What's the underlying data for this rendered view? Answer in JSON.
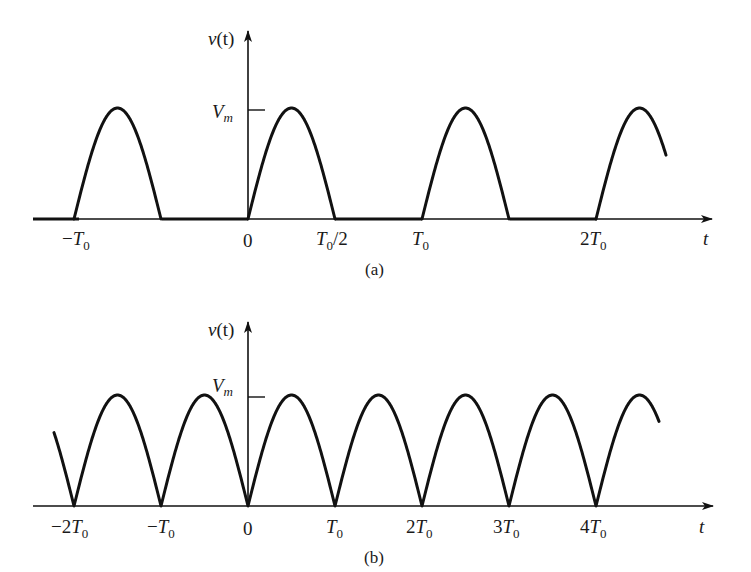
{
  "figure": {
    "panels": [
      {
        "id": "a",
        "caption": "(a)",
        "description": "Half-wave rectified sinusoid",
        "y_axis_label": {
          "base": "v",
          "arg": "(t)"
        },
        "x_axis_label": "t",
        "peak_label": {
          "base": "V",
          "sub": "m"
        },
        "ticks": [
          {
            "prefix": "−",
            "base": "T",
            "sub": "0",
            "suffix": "",
            "value": -1.0
          },
          {
            "prefix": "",
            "base": "0",
            "sub": "",
            "suffix": "",
            "value": 0.0
          },
          {
            "prefix": "",
            "base": "T",
            "sub": "0",
            "suffix": "/2",
            "value": 0.5
          },
          {
            "prefix": "",
            "base": "T",
            "sub": "0",
            "suffix": "",
            "value": 1.0
          },
          {
            "prefix": "2",
            "base": "T",
            "sub": "0",
            "suffix": "",
            "value": 2.0
          }
        ]
      },
      {
        "id": "b",
        "caption": "(b)",
        "description": "Full-wave rectified sinusoid",
        "y_axis_label": {
          "base": "v",
          "arg": "(t)"
        },
        "x_axis_label": "t",
        "peak_label": {
          "base": "V",
          "sub": "m"
        },
        "ticks": [
          {
            "prefix": "−2",
            "base": "T",
            "sub": "0",
            "suffix": "",
            "value": -2.0
          },
          {
            "prefix": "−",
            "base": "T",
            "sub": "0",
            "suffix": "",
            "value": -1.0
          },
          {
            "prefix": "",
            "base": "0",
            "sub": "",
            "suffix": "",
            "value": 0.0
          },
          {
            "prefix": "",
            "base": "T",
            "sub": "0",
            "suffix": "",
            "value": 1.0
          },
          {
            "prefix": "2",
            "base": "T",
            "sub": "0",
            "suffix": "",
            "value": 2.0
          },
          {
            "prefix": "3",
            "base": "T",
            "sub": "0",
            "suffix": "",
            "value": 3.0
          },
          {
            "prefix": "4",
            "base": "T",
            "sub": "0",
            "suffix": "",
            "value": 4.0
          }
        ]
      }
    ],
    "colors": {
      "ink": "#111111",
      "background": "#ffffff"
    }
  }
}
